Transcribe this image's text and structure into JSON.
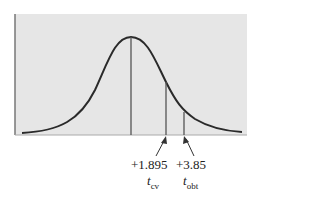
{
  "figure": {
    "type": "t-distribution diagram",
    "background": "#e6e6e6",
    "curve_color": "#2a2a2a",
    "critical": {
      "value_label": "+1.895",
      "symbol": "t",
      "subscript": "cv"
    },
    "obtained": {
      "value_label": "+3.85",
      "symbol": "t",
      "subscript": "obt"
    }
  }
}
